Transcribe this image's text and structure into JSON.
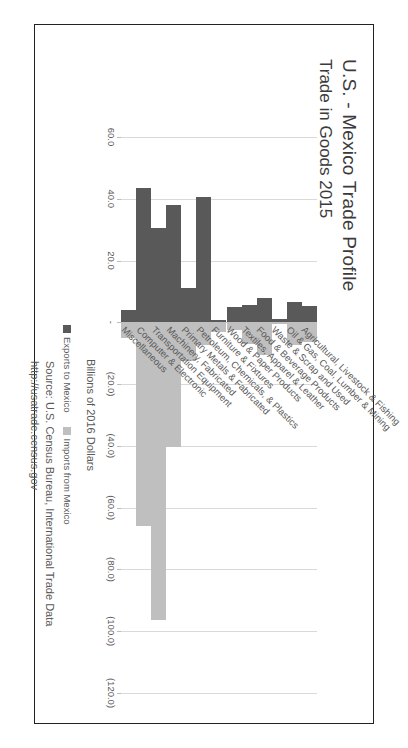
{
  "chart_data": {
    "type": "bar",
    "orientation": "horizontal-grouped",
    "title": "U.S. - Mexico Trade Profile",
    "subtitle": "Trade in Goods 2015",
    "xlabel": "Billions of 2016 Dollars",
    "ylabel": "",
    "xlim": [
      60,
      -120
    ],
    "xticks": [
      60,
      40,
      20,
      0,
      -20,
      -40,
      -60,
      -80,
      -100,
      -120
    ],
    "xtick_labels": [
      "60.0",
      "40.0",
      "20.0",
      "-",
      "(20.0)",
      "(40.0)",
      "(60.0)",
      "(80.0)",
      "(100.0)",
      "(120.0)"
    ],
    "grid": true,
    "legend_position": "bottom-right",
    "categories": [
      "Agricultural, Livestock & Fishing",
      "Oil & Gas, Coal, Lumber & Mining",
      "Waste & Scrap and Used",
      "Food & Beverage Products",
      "Textiles, Apparel & Leather",
      "Wood & Paper Products",
      "Furniture & Fixtures",
      "Petroleum, Chemicals, & Plastics",
      "Primary Metals & Fabricated",
      "Machinery, Fabricated",
      "Transportation Equipment",
      "Computer & Electronic",
      "Miscellaneous"
    ],
    "series": [
      {
        "name": "Exports to Mexico",
        "color": "#595959",
        "values": [
          5.2,
          6.5,
          1.2,
          8.0,
          5.5,
          5.0,
          0.6,
          40.5,
          11.0,
          38.0,
          30.5,
          43.5,
          4.0
        ]
      },
      {
        "name": "Imports from Mexico",
        "color": "#bfbfbf",
        "values": [
          -6.5,
          -7.5,
          -0.5,
          -10.5,
          -7.0,
          -2.5,
          -3.0,
          -7.5,
          -12.5,
          -40.5,
          -96.5,
          -66.0,
          -5.0
        ]
      }
    ]
  },
  "legend": {
    "items": [
      {
        "label": "Exports to Mexico",
        "swatch": "exp"
      },
      {
        "label": "Imports from Mexico",
        "swatch": "imp"
      }
    ]
  },
  "source": {
    "line1": "Source: U.S. Census Bureau, International Trade Data",
    "line2": "http://usatrade.census.gov"
  },
  "colors": {
    "exports": "#595959",
    "imports": "#bfbfbf",
    "grid": "#d9d9d9",
    "text": "#595959",
    "frame": "#222222"
  }
}
